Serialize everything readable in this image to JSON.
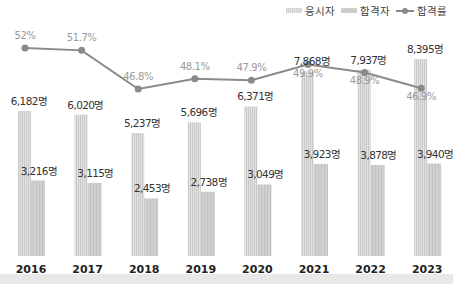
{
  "legend": {
    "applicants": "응시자",
    "passers": "합격자",
    "rate": "합격률"
  },
  "colors": {
    "applicants_bar": "#d6d6d6",
    "passers_bar": "#cbcbcb",
    "rate_line": "#8a8a8a",
    "rate_label": "#9a9a9a",
    "value_label": "#333333",
    "axis_label": "#222222"
  },
  "chart_data": {
    "type": "bar",
    "title": "",
    "xlabel": "",
    "ylabel": "",
    "categories": [
      "2016",
      "2017",
      "2018",
      "2019",
      "2020",
      "2021",
      "2022",
      "2023"
    ],
    "series": [
      {
        "name": "응시자",
        "type": "bar",
        "values": [
          6182,
          6020,
          5237,
          5696,
          6371,
          7868,
          7937,
          8395
        ],
        "labels": [
          "6,182명",
          "6,020명",
          "5,237명",
          "5,696명",
          "6,371명",
          "7,868명",
          "7,937명",
          "8,395명"
        ]
      },
      {
        "name": "합격자",
        "type": "bar",
        "values": [
          3216,
          3115,
          2453,
          2738,
          3049,
          3923,
          3878,
          3940
        ],
        "labels": [
          "3,216명",
          "3,115명",
          "2,453명",
          "2,738명",
          "3,049명",
          "3,923명",
          "3,878명",
          "3,940명"
        ]
      },
      {
        "name": "합격률",
        "type": "line",
        "values": [
          52.0,
          51.7,
          46.8,
          48.1,
          47.9,
          49.9,
          48.9,
          46.9
        ],
        "labels": [
          "52%",
          "51.7%",
          "46.8%",
          "48.1%",
          "47.9%",
          "49.9%",
          "48.9%",
          "46.9%"
        ]
      }
    ],
    "grid": false,
    "legend_position": "top-right"
  }
}
